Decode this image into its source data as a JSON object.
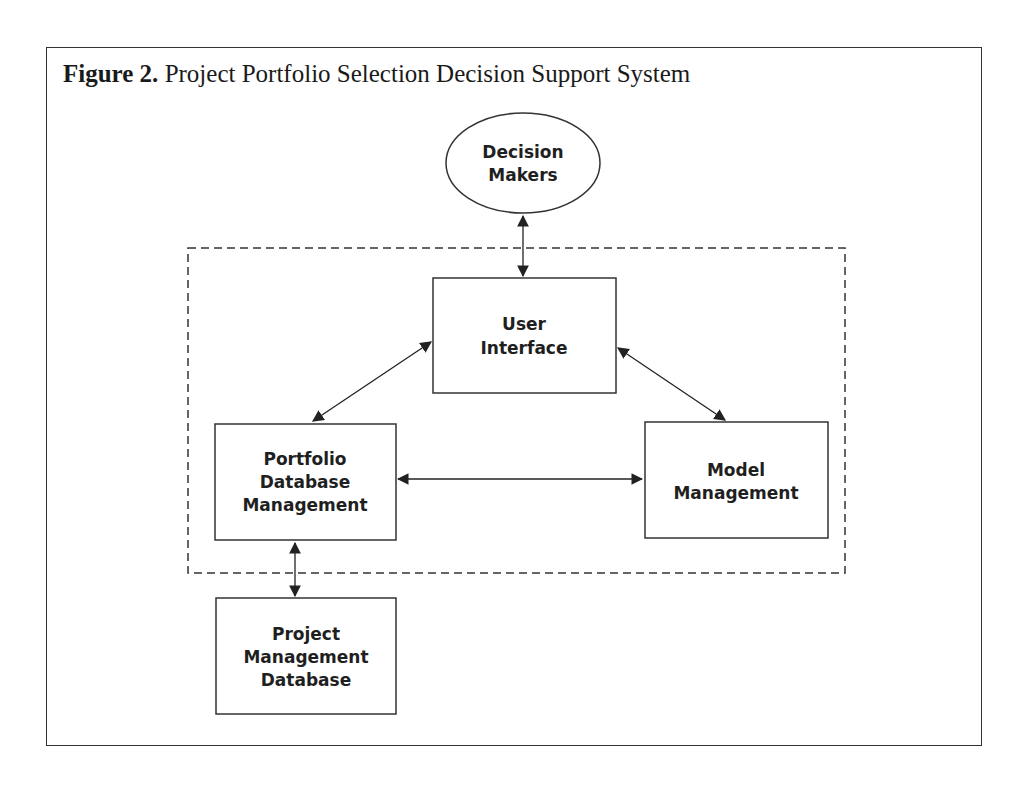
{
  "figure": {
    "label": "Figure 2.",
    "title": "Project Portfolio Selection Decision Support System"
  },
  "nodes": {
    "decision_makers": {
      "shape": "ellipse",
      "lines": [
        "Decision",
        "Makers"
      ]
    },
    "user_interface": {
      "shape": "rectangle",
      "lines": [
        "User",
        "Interface"
      ]
    },
    "portfolio_dbm": {
      "shape": "rectangle",
      "lines": [
        "Portfolio",
        "Database",
        "Management"
      ]
    },
    "model_management": {
      "shape": "rectangle",
      "lines": [
        "Model",
        "Management"
      ]
    },
    "project_mgmt_db": {
      "shape": "rectangle",
      "lines": [
        "Project",
        "Management",
        "Database"
      ]
    }
  },
  "boundary": {
    "style": "dashed",
    "contains": [
      "user_interface",
      "portfolio_dbm",
      "model_management"
    ]
  },
  "edges": [
    {
      "from": "decision_makers",
      "to": "user_interface",
      "direction": "bidirectional"
    },
    {
      "from": "user_interface",
      "to": "portfolio_dbm",
      "direction": "bidirectional"
    },
    {
      "from": "user_interface",
      "to": "model_management",
      "direction": "bidirectional"
    },
    {
      "from": "portfolio_dbm",
      "to": "model_management",
      "direction": "bidirectional"
    },
    {
      "from": "portfolio_dbm",
      "to": "project_mgmt_db",
      "direction": "bidirectional"
    }
  ],
  "colors": {
    "stroke": "#333333",
    "text": "#1f1f1f",
    "background": "#ffffff"
  }
}
